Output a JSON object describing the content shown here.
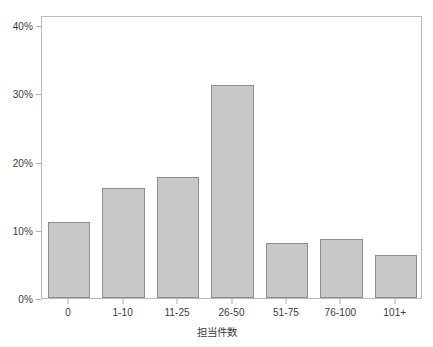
{
  "chart_data": {
    "type": "bar",
    "title": "",
    "subtitle": "",
    "xlabel": "担当件数",
    "ylabel": "",
    "categories": [
      "0",
      "1-10",
      "11-25",
      "26-50",
      "51-75",
      "76-100",
      "101+"
    ],
    "values": [
      11.2,
      16.2,
      17.7,
      31.3,
      8.1,
      8.6,
      6.3
    ],
    "value_unit": "%",
    "ylim": [
      0,
      41.5
    ],
    "ytick_values": [
      0,
      10,
      20,
      30,
      40
    ],
    "ytick_labels": [
      "0%",
      "10%",
      "20%",
      "30%",
      "40%"
    ],
    "grid": false,
    "legend": null,
    "annotations": [],
    "colors": {
      "bar_fill": "#c8c8c8",
      "bar_edge": "#8e8e8e",
      "frame": "#b9b9b9",
      "axis": "#b0b0b0",
      "text": "#3a3a3a",
      "background": "#ffffff"
    }
  },
  "axes": {
    "y_ticks": [
      {
        "label": "40%",
        "value": 40
      },
      {
        "label": "30%",
        "value": 30
      },
      {
        "label": "20%",
        "value": 20
      },
      {
        "label": "10%",
        "value": 10
      },
      {
        "label": "0%",
        "value": 0
      }
    ],
    "x_ticks": [
      {
        "label": "0",
        "value": 11.2
      },
      {
        "label": "1-10",
        "value": 16.2
      },
      {
        "label": "11-25",
        "value": 17.7
      },
      {
        "label": "26-50",
        "value": 31.3
      },
      {
        "label": "51-75",
        "value": 8.1
      },
      {
        "label": "76-100",
        "value": 8.6
      },
      {
        "label": "101+",
        "value": 6.3
      }
    ],
    "x_title": "担当件数"
  }
}
